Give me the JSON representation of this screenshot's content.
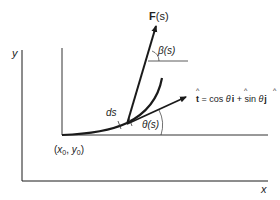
{
  "diagram": {
    "axes": {
      "x_label": "x",
      "y_label": "y"
    },
    "origin_point": {
      "label_prefix": "(",
      "x_sym": "x",
      "x_sub": "0",
      "sep": ", ",
      "y_sym": "y",
      "y_sub": "0",
      "label_suffix": ")"
    },
    "force": {
      "label_bold": "F",
      "label_arg": "(s)"
    },
    "beta": {
      "sym": "β",
      "arg": "(s)"
    },
    "theta": {
      "sym": "θ",
      "arg": "(s)"
    },
    "ds": {
      "label": "ds"
    },
    "tangent": {
      "lhs": "t",
      "eq": " = cos ",
      "theta1": "θ",
      "i": "i",
      "plus": " + sin ",
      "theta2": "θ",
      "j": "j",
      "hat": "^"
    },
    "colors": {
      "stroke": "#1a1a1a",
      "text": "#222222"
    }
  }
}
